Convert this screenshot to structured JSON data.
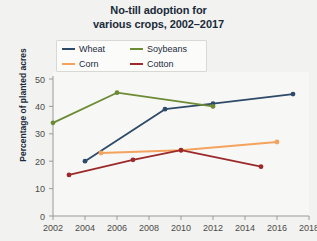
{
  "chart_data": {
    "type": "line",
    "title": "No-till adoption for various crops, 2002–2017",
    "title_line1": "No-till adoption for",
    "title_line2": "various crops, 2002–2017",
    "xlabel": "",
    "ylabel": "Percentage of planted acres",
    "xlim": [
      2002,
      2018
    ],
    "ylim": [
      0,
      50
    ],
    "xticks": [
      2002,
      2004,
      2006,
      2008,
      2010,
      2012,
      2014,
      2016,
      2018
    ],
    "yticks": [
      0,
      10,
      20,
      30,
      40,
      50
    ],
    "grid": false,
    "legend_position": "upper-left",
    "series": [
      {
        "name": "Wheat",
        "color": "#2d4a68",
        "x": [
          2004,
          2009,
          2012,
          2017
        ],
        "values": [
          20,
          39,
          41,
          44.5
        ]
      },
      {
        "name": "Soybeans",
        "color": "#6d8b34",
        "x": [
          2002,
          2006,
          2012
        ],
        "values": [
          34,
          45,
          40
        ]
      },
      {
        "name": "Corn",
        "color": "#f4a35d",
        "x": [
          2005,
          2010,
          2016
        ],
        "values": [
          23,
          24,
          27
        ]
      },
      {
        "name": "Cotton",
        "color": "#9c2a2a",
        "x": [
          2003,
          2007,
          2010,
          2015
        ],
        "values": [
          15,
          20.5,
          24,
          18
        ]
      }
    ]
  },
  "legend": {
    "items": [
      {
        "label": "Wheat",
        "color": "#2d4a68"
      },
      {
        "label": "Soybeans",
        "color": "#6d8b34"
      },
      {
        "label": "Corn",
        "color": "#f4a35d"
      },
      {
        "label": "Cotton",
        "color": "#9c2a2a"
      }
    ]
  },
  "axes": {
    "y_title": "Percentage of planted acres",
    "y_tick_labels": [
      "50",
      "40",
      "30",
      "20",
      "10",
      "0"
    ],
    "x_tick_labels": [
      "2002",
      "2004",
      "2006",
      "2008",
      "2010",
      "2012",
      "2014",
      "2016",
      "2018"
    ]
  }
}
